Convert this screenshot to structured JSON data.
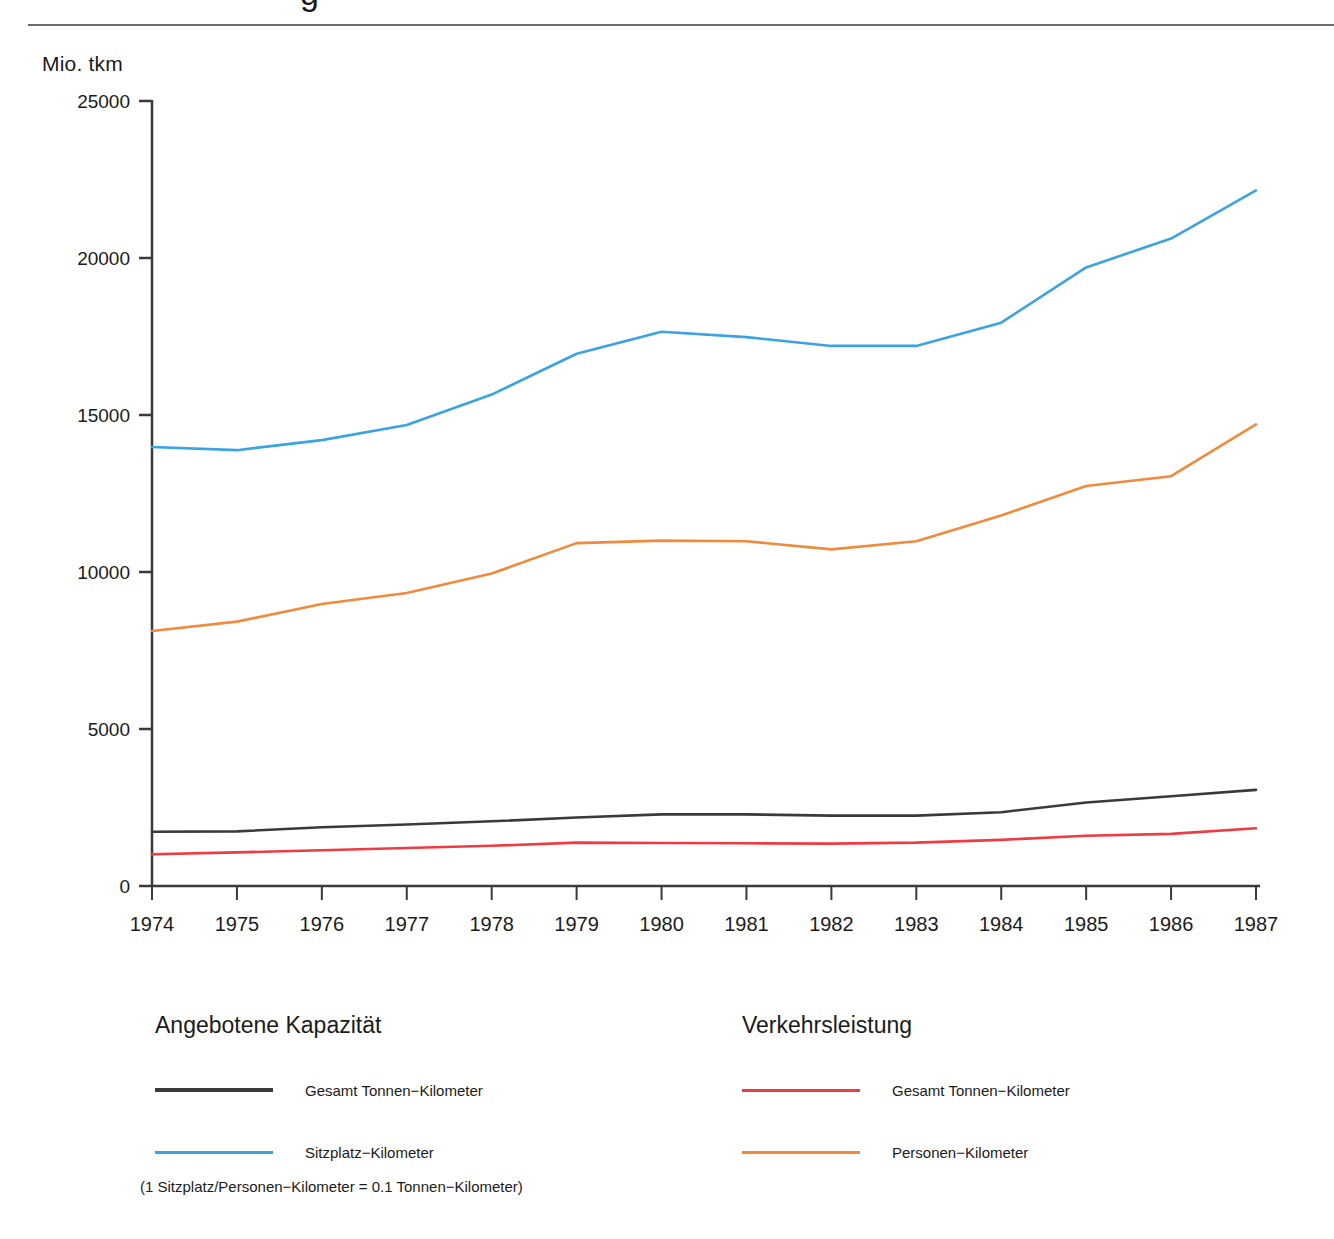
{
  "page": {
    "cropped_title_fragment": "g",
    "unit_label": "Mio. tkm"
  },
  "legends": {
    "left": {
      "title": "Angebotene Kapazität",
      "entries": [
        {
          "label": "Gesamt Tonnen−Kilometer",
          "color": "#3a3a3a"
        },
        {
          "label": "Sitzplatz−Kilometer",
          "color": "#3aa3e0"
        }
      ]
    },
    "right": {
      "title": "Verkehrsleistung",
      "entries": [
        {
          "label": "Gesamt Tonnen−Kilometer",
          "color": "#ee3b44"
        },
        {
          "label": "Personen−Kilometer",
          "color": "#f08a3c"
        }
      ]
    },
    "note": "(1 Sitzplatz/Personen−Kilometer = 0.1 Tonnen−Kilometer)"
  },
  "chart_data": {
    "type": "line",
    "title": "",
    "xlabel": "",
    "ylabel": "Mio. tkm",
    "ylim": [
      0,
      25000
    ],
    "yticks": [
      0,
      5000,
      10000,
      15000,
      20000,
      25000
    ],
    "ytick_labels": [
      "0",
      "5000",
      "10000",
      "15000",
      "20000",
      "25000"
    ],
    "grid": false,
    "legend_position": "below",
    "categories": [
      1974,
      1975,
      1976,
      1977,
      1978,
      1979,
      1980,
      1981,
      1982,
      1983,
      1984,
      1985,
      1986,
      1987
    ],
    "xtick_labels": [
      "1974",
      "1975",
      "1976",
      "1977",
      "1978",
      "1979",
      "1980",
      "1981",
      "1982",
      "1983",
      "1984",
      "1985",
      "1986",
      "1987"
    ],
    "series": [
      {
        "name": "Sitzplatz−Kilometer",
        "group": "Angebotene Kapazität",
        "color": "#3aa3e0",
        "values": [
          13980,
          13880,
          14200,
          14680,
          15650,
          16950,
          17650,
          17480,
          17200,
          17200,
          17940,
          19700,
          20620,
          22150
        ]
      },
      {
        "name": "Personen−Kilometer",
        "group": "Verkehrsleistung",
        "color": "#f08a3c",
        "values": [
          8120,
          8420,
          8980,
          9330,
          9950,
          10920,
          11000,
          10980,
          10720,
          10980,
          11800,
          12740,
          13050,
          14700
        ]
      },
      {
        "name": "Gesamt Tonnen−Kilometer (Angebotene Kapazität)",
        "group": "Angebotene Kapazität",
        "color": "#3a3a3a",
        "values": [
          1730,
          1740,
          1870,
          1960,
          2060,
          2180,
          2280,
          2280,
          2240,
          2240,
          2350,
          2660,
          2860,
          3060
        ]
      },
      {
        "name": "Gesamt Tonnen−Kilometer (Verkehrsleistung)",
        "group": "Verkehrsleistung",
        "color": "#ee3b44",
        "values": [
          1010,
          1070,
          1140,
          1210,
          1280,
          1380,
          1370,
          1360,
          1350,
          1380,
          1470,
          1600,
          1660,
          1840
        ]
      }
    ]
  },
  "axis_geometry": {
    "x0": 152,
    "x1": 1256,
    "y_zero": 886,
    "y_top": 101
  }
}
